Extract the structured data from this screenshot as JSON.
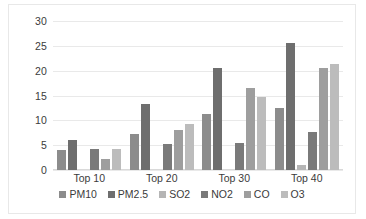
{
  "chart_data": {
    "type": "bar",
    "title": "",
    "xlabel": "",
    "ylabel": "",
    "categories": [
      "Top 10",
      "Top 20",
      "Top 30",
      "Top 40"
    ],
    "series": [
      {
        "name": "PM10",
        "color": "#8c8c8c",
        "values": [
          4.0,
          7.3,
          11.3,
          12.4
        ]
      },
      {
        "name": "PM2.5",
        "color": "#6e6e6e",
        "values": [
          6.0,
          13.2,
          20.6,
          25.6
        ]
      },
      {
        "name": "SO2",
        "color": "#b5b5b5",
        "values": [
          0.0,
          0.0,
          0.0,
          1.0
        ]
      },
      {
        "name": "NO2",
        "color": "#7a7a7a",
        "values": [
          4.2,
          5.3,
          5.4,
          7.7
        ]
      },
      {
        "name": "CO",
        "color": "#9e9e9e",
        "values": [
          2.3,
          8.1,
          16.6,
          20.5
        ]
      },
      {
        "name": "O3",
        "color": "#bcbcbc",
        "values": [
          4.2,
          9.2,
          14.7,
          21.3
        ]
      }
    ],
    "ylim": [
      0,
      30
    ],
    "ytick_step": 5,
    "yticks": [
      "0",
      "5",
      "10",
      "15",
      "20",
      "25",
      "30"
    ],
    "grid": "horizontal",
    "legend_position": "bottom"
  }
}
